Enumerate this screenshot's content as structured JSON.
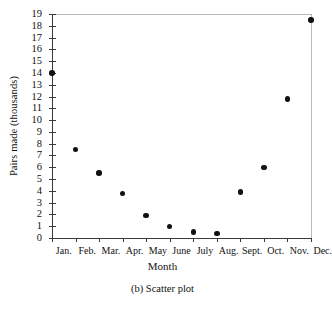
{
  "chart_data": {
    "type": "scatter",
    "title": "",
    "caption": "(b) Scatter plot",
    "xlabel": "Month",
    "ylabel": "Pairs made (thousands)",
    "categories": [
      "Jan.",
      "Feb.",
      "Mar.",
      "Apr.",
      "May",
      "June",
      "July",
      "Aug.",
      "Sept.",
      "Oct.",
      "Nov.",
      "Dec."
    ],
    "values": [
      14.0,
      7.5,
      5.5,
      3.8,
      1.9,
      1.0,
      0.5,
      0.4,
      3.9,
      6.0,
      11.8,
      18.5
    ],
    "ylim": [
      0,
      19
    ],
    "ytick_labels": [
      "0",
      "1",
      "2",
      "3",
      "4",
      "5",
      "6",
      "7",
      "8",
      "9",
      "10",
      "11",
      "12",
      "13",
      "14",
      "15",
      "16",
      "17",
      "18",
      "19"
    ],
    "ytick_values": [
      0,
      1,
      2,
      3,
      4,
      5,
      6,
      7,
      8,
      9,
      10,
      11,
      12,
      13,
      14,
      15,
      16,
      17,
      18,
      19
    ],
    "grid": false,
    "legend": false,
    "marker": "filled-circle",
    "marker_color": "#111111",
    "axis_color": "#3a3a3a"
  }
}
